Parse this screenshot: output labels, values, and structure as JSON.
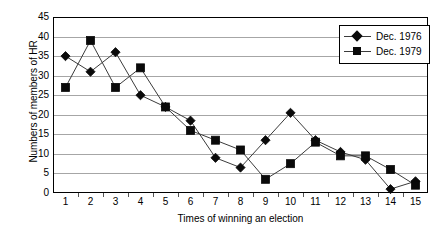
{
  "chart_data": {
    "type": "line",
    "title": "",
    "xlabel": "Times of winning an election",
    "ylabel": "Numbers of members of HR",
    "categories": [
      "1",
      "2",
      "3",
      "4",
      "5",
      "6",
      "7",
      "8",
      "9",
      "10",
      "11",
      "12",
      "13",
      "14",
      "15"
    ],
    "ylim": [
      0,
      45
    ],
    "yticks": [
      "0",
      "5",
      "10",
      "15",
      "20",
      "25",
      "30",
      "35",
      "40",
      "45"
    ],
    "grid": true,
    "legend_position": "top-right",
    "series": [
      {
        "name": "Dec. 1976",
        "marker": "diamond",
        "values": [
          35,
          31,
          36,
          25,
          22,
          18.5,
          9,
          6.5,
          13.5,
          20.5,
          13.5,
          10.5,
          8.5,
          1,
          3
        ]
      },
      {
        "name": "Dec. 1979",
        "marker": "square",
        "values": [
          27,
          39,
          27,
          32,
          22,
          16,
          13.5,
          11,
          3.5,
          7.5,
          13,
          9.5,
          9.5,
          6,
          2
        ]
      }
    ]
  },
  "colors": {
    "line": "#3b3b3b",
    "marker": "#0a0a0a",
    "gridline": "#a6a6a6",
    "axis": "#000000",
    "background": "#ffffff"
  }
}
